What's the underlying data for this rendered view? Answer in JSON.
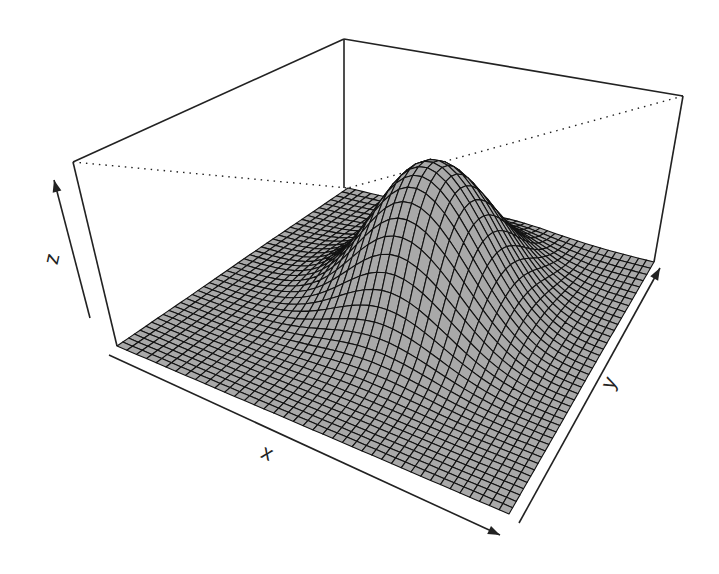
{
  "chart_data": {
    "type": "surface3d",
    "title": "",
    "function": "bivariate normal density (peak centered slightly off-center)",
    "xlabel": "x",
    "ylabel": "y",
    "zlabel": "z",
    "grid": {
      "nx": 40,
      "ny": 40
    },
    "x_range": [
      0,
      1
    ],
    "y_range": [
      0,
      1
    ],
    "z_range": [
      0,
      1
    ],
    "peak": {
      "x": 0.52,
      "y": 0.62,
      "z": 0.82,
      "sigma_x": 0.15,
      "sigma_y": 0.16
    },
    "ticks": "none (arrows only)",
    "box": true,
    "back_edges": "dotted",
    "surface_fill": "#a9a9a9",
    "mesh_color": "#111111"
  },
  "axes": {
    "x_label": "x",
    "y_label": "y",
    "z_label": "z"
  },
  "projection": {
    "floor": {
      "left": [
        117,
        346
      ],
      "front": [
        509,
        514
      ],
      "right": [
        654,
        262
      ],
      "back": [
        348,
        188
      ]
    },
    "top": {
      "left": [
        73,
        162
      ],
      "back": [
        344,
        39
      ],
      "right": [
        683,
        96
      ],
      "front": [
        470,
        300
      ]
    }
  }
}
